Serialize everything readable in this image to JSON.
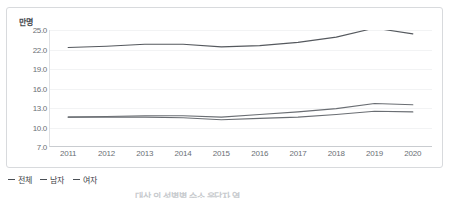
{
  "chart_data": {
    "type": "line",
    "title": "",
    "unit_label": "만명",
    "xlabel": "",
    "ylabel": "",
    "categories": [
      "2011",
      "2012",
      "2013",
      "2014",
      "2015",
      "2016",
      "2017",
      "2018",
      "2019",
      "2020"
    ],
    "ylim": [
      7.0,
      25.0
    ],
    "yticks": [
      "25.0",
      "22.0",
      "19.0",
      "16.0",
      "13.0",
      "10.0",
      "7.0"
    ],
    "ytick_values": [
      25.0,
      22.0,
      19.0,
      16.0,
      13.0,
      10.0,
      7.0
    ],
    "grid": true,
    "legend_position": "bottom-left",
    "series": [
      {
        "name": "전체",
        "color": "#55595e",
        "values": [
          22.3,
          22.5,
          22.8,
          22.8,
          22.4,
          22.6,
          23.1,
          23.9,
          25.3,
          24.4
        ]
      },
      {
        "name": "남자",
        "color": "#6a6e73",
        "values": [
          11.6,
          11.7,
          11.8,
          11.8,
          11.6,
          12.0,
          12.4,
          12.9,
          13.7,
          13.5
        ]
      },
      {
        "name": "여자",
        "color": "#6a6e73",
        "values": [
          11.6,
          11.6,
          11.6,
          11.5,
          11.2,
          11.4,
          11.6,
          12.0,
          12.5,
          12.4
        ]
      }
    ]
  },
  "legend": {
    "items": [
      {
        "label": "전체"
      },
      {
        "label": "남자"
      },
      {
        "label": "여자"
      }
    ]
  },
  "footer": {
    "text": "대상 의 성별별  수소 응답자 열"
  }
}
